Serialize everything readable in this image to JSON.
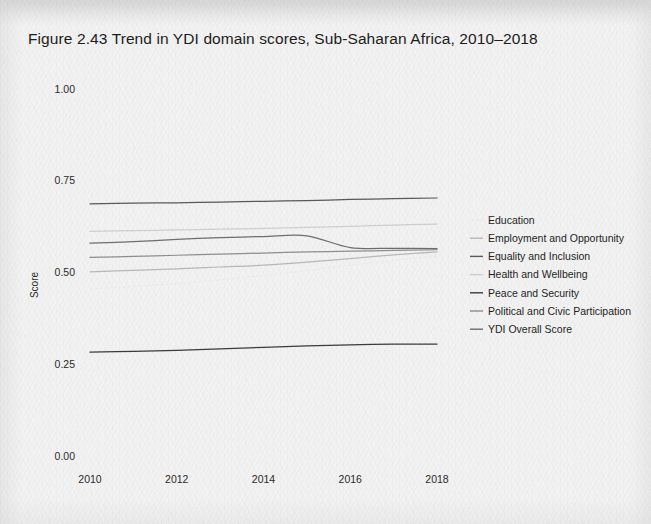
{
  "figure": {
    "title": "Figure 2.43   Trend in YDI domain scores, Sub-Saharan Africa, 2010–2018"
  },
  "axes": {
    "y_label": "Score",
    "y_ticks": [
      "0.00",
      "0.25",
      "0.50",
      "0.75",
      "1.00"
    ],
    "x_ticks": [
      "2010",
      "2012",
      "2014",
      "2016",
      "2018"
    ]
  },
  "legend": {
    "entries": [
      {
        "label": "Education",
        "color": "#eeeeee"
      },
      {
        "label": "Employment and Opportunity",
        "color": "#b9b9b9"
      },
      {
        "label": "Equality and Inclusion",
        "color": "#5a5a5a"
      },
      {
        "label": "Health and Wellbeing",
        "color": "#cfcfcf"
      },
      {
        "label": "Peace and Security",
        "color": "#3c3c3c"
      },
      {
        "label": "Political and Civic Participation",
        "color": "#8f8f8f"
      },
      {
        "label": "YDI Overall Score",
        "color": "#6e6e6e"
      }
    ]
  },
  "chart_data": {
    "type": "line",
    "title": "Figure 2.43   Trend in YDI domain scores, Sub-Saharan Africa, 2010–2018",
    "xlabel": "",
    "ylabel": "Score",
    "xlim": [
      2010,
      2018
    ],
    "ylim": [
      0.0,
      1.0
    ],
    "grid": false,
    "legend_position": "right",
    "x": [
      2010,
      2011,
      2012,
      2013,
      2014,
      2015,
      2016,
      2017,
      2018
    ],
    "series": [
      {
        "name": "Education",
        "color": "#eeeeee",
        "values": [
          0.455,
          0.462,
          0.47,
          0.48,
          0.492,
          0.505,
          0.52,
          0.533,
          0.545
        ]
      },
      {
        "name": "Employment and Opportunity",
        "color": "#b9b9b9",
        "values": [
          0.502,
          0.506,
          0.51,
          0.515,
          0.52,
          0.528,
          0.538,
          0.548,
          0.556
        ]
      },
      {
        "name": "Equality and Inclusion",
        "color": "#5a5a5a",
        "values": [
          0.687,
          0.689,
          0.69,
          0.692,
          0.694,
          0.696,
          0.699,
          0.701,
          0.703
        ]
      },
      {
        "name": "Health and Wellbeing",
        "color": "#cfcfcf",
        "values": [
          0.612,
          0.614,
          0.616,
          0.618,
          0.62,
          0.623,
          0.626,
          0.629,
          0.632
        ]
      },
      {
        "name": "Peace and Security",
        "color": "#3c3c3c",
        "values": [
          0.283,
          0.285,
          0.288,
          0.292,
          0.296,
          0.3,
          0.303,
          0.305,
          0.305
        ]
      },
      {
        "name": "Political and Civic Participation",
        "color": "#8f8f8f",
        "values": [
          0.541,
          0.544,
          0.547,
          0.55,
          0.553,
          0.556,
          0.558,
          0.56,
          0.562
        ]
      },
      {
        "name": "YDI Overall Score",
        "color": "#6e6e6e",
        "values": [
          0.58,
          0.584,
          0.59,
          0.595,
          0.598,
          0.6,
          0.568,
          0.566,
          0.565
        ]
      }
    ]
  }
}
